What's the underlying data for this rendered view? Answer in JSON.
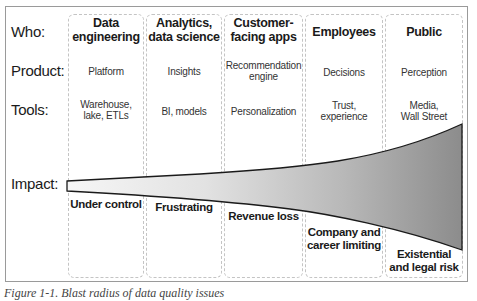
{
  "diagram": {
    "row_labels": {
      "who": "Who:",
      "product": "Product:",
      "tools": "Tools:",
      "impact": "Impact:"
    },
    "columns": [
      {
        "who": [
          "Data",
          "engineering"
        ],
        "product": [
          "Platform"
        ],
        "tools": [
          "Warehouse,",
          "lake, ETLs"
        ],
        "impact": [
          "Under control"
        ]
      },
      {
        "who": [
          "Analytics,",
          "data science"
        ],
        "product": [
          "Insights"
        ],
        "tools": [
          "BI, models"
        ],
        "impact": [
          "Frustrating"
        ]
      },
      {
        "who": [
          "Customer-",
          "facing apps"
        ],
        "product": [
          "Recommendation",
          "engine"
        ],
        "tools": [
          "Personalization"
        ],
        "impact": [
          "Revenue loss"
        ]
      },
      {
        "who": [
          "Employees"
        ],
        "product": [
          "Decisions"
        ],
        "tools": [
          "Trust,",
          "experience"
        ],
        "impact": [
          "Company and",
          "career limiting"
        ]
      },
      {
        "who": [
          "Public"
        ],
        "product": [
          "Perception"
        ],
        "tools": [
          "Media,",
          "Wall Street"
        ],
        "impact": [
          "Existential",
          "and legal risk"
        ]
      }
    ],
    "funnel": {
      "fill_start": "#f4f4f4",
      "fill_end": "#8f8f8f",
      "stroke": "#1a1a1a"
    },
    "colors": {
      "frame_border": "#9a9a9a",
      "column_border": "#c4c4c4"
    }
  },
  "caption": "Figure 1-1. Blast radius of data quality issues"
}
